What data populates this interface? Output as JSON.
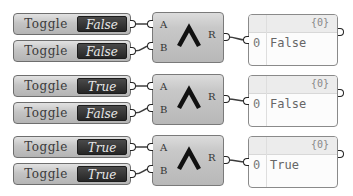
{
  "canvas": {
    "background": "#ffffff"
  },
  "groups": [
    {
      "toggles": [
        {
          "label": "Toggle",
          "value": "False"
        },
        {
          "label": "Toggle",
          "value": "False"
        }
      ],
      "gate": {
        "input_a": "A",
        "input_b": "B",
        "output": "R",
        "symbol": "and-icon"
      },
      "panel": {
        "path": "{0}",
        "index": "0",
        "value": "False"
      }
    },
    {
      "toggles": [
        {
          "label": "Toggle",
          "value": "True"
        },
        {
          "label": "Toggle",
          "value": "False"
        }
      ],
      "gate": {
        "input_a": "A",
        "input_b": "B",
        "output": "R",
        "symbol": "and-icon"
      },
      "panel": {
        "path": "{0}",
        "index": "0",
        "value": "False"
      }
    },
    {
      "toggles": [
        {
          "label": "Toggle",
          "value": "True"
        },
        {
          "label": "Toggle",
          "value": "True"
        }
      ],
      "gate": {
        "input_a": "A",
        "input_b": "B",
        "output": "R",
        "symbol": "and-icon"
      },
      "panel": {
        "path": "{0}",
        "index": "0",
        "value": "True"
      }
    }
  ]
}
